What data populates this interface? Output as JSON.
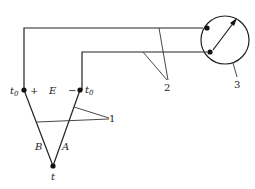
{
  "diagram": {
    "labels": {
      "terminal_left": "t",
      "terminal_left_sub": "0",
      "terminal_right": "t",
      "terminal_right_sub": "0",
      "plus": "+",
      "minus": "−",
      "emf": "E",
      "wire_b": "B",
      "wire_a": "A",
      "hot_junction": "t",
      "callout_1": "1",
      "callout_2": "2",
      "callout_3": "3"
    },
    "components": [
      {
        "id": "1",
        "name": "thermocouple-wires"
      },
      {
        "id": "2",
        "name": "connecting-leads"
      },
      {
        "id": "3",
        "name": "measuring-instrument"
      }
    ]
  }
}
